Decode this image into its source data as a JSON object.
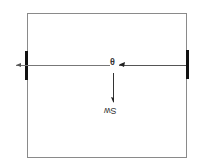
{
  "diagram": {
    "title": "",
    "box": {
      "x": 27,
      "y": 13,
      "width": 159,
      "height": 144,
      "stroke": "#8a8a8a"
    },
    "left_support": {
      "x": 25,
      "y": 51,
      "width": 3,
      "height": 29,
      "color": "#111111"
    },
    "right_support": {
      "x": 186,
      "y": 50,
      "width": 3,
      "height": 29,
      "color": "#111111"
    },
    "horizontal_line": {
      "y": 65,
      "x1": 16,
      "x2": 186,
      "color": "#777777"
    },
    "vertical_arrow": {
      "x": 113,
      "y1": 73,
      "y2": 103,
      "color": "#333333"
    },
    "labels": {
      "center_angle": "θ",
      "weight": "Sw",
      "left_mark": "F"
    },
    "colors": {
      "box": "#8a8a8a",
      "support": "#111111",
      "line": "#777777",
      "text": "#333333"
    }
  }
}
